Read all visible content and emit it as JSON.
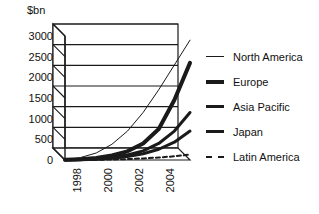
{
  "chart_data": {
    "type": "line",
    "title": "",
    "subtitle": "",
    "xlabel": "",
    "ylabel": "$bn",
    "unit_label": "$bn",
    "grid": true,
    "style": "3d-perspective",
    "legend_position": "right",
    "x": [
      1997,
      1998,
      1999,
      2000,
      2001,
      2002,
      2003,
      2004,
      2005
    ],
    "xtick_labels": [
      "1998",
      "2000",
      "2002",
      "2004"
    ],
    "xtick_values": [
      1998,
      2000,
      2002,
      2004
    ],
    "xlim": [
      1997,
      2005
    ],
    "ylim": [
      0,
      3000
    ],
    "ytick_labels": [
      "0",
      "500",
      "1000",
      "1500",
      "2000",
      "2500",
      "3000"
    ],
    "ytick_values": [
      0,
      500,
      1000,
      1500,
      2000,
      2500,
      3000
    ],
    "series": [
      {
        "name": "North America",
        "values": [
          10,
          60,
          170,
          380,
          700,
          1150,
          1700,
          2300,
          2900
        ],
        "line_width": 1,
        "dash": false,
        "color": "#1a1a1a"
      },
      {
        "name": "Europe",
        "values": [
          5,
          20,
          50,
          110,
          210,
          400,
          750,
          1450,
          2350
        ],
        "line_width": 4,
        "dash": false,
        "color": "#1a1a1a"
      },
      {
        "name": "Asia Pacific",
        "values": [
          3,
          12,
          30,
          65,
          120,
          220,
          400,
          700,
          1150
        ],
        "line_width": 3,
        "dash": false,
        "color": "#1a1a1a"
      },
      {
        "name": "Japan",
        "values": [
          2,
          8,
          20,
          45,
          85,
          150,
          260,
          430,
          700
        ],
        "line_width": 3,
        "dash": false,
        "color": "#1a1a1a"
      },
      {
        "name": "Latin America",
        "values": [
          1,
          3,
          6,
          12,
          22,
          38,
          60,
          90,
          130
        ],
        "line_width": 2,
        "dash": true,
        "color": "#1a1a1a"
      }
    ]
  },
  "legend": {
    "items": [
      {
        "label": "North America",
        "weight_class": "lw-1"
      },
      {
        "label": "Europe",
        "weight_class": "lw-4"
      },
      {
        "label": "Asia Pacific",
        "weight_class": "lw-3"
      },
      {
        "label": "Japan",
        "weight_class": "lw-3"
      },
      {
        "label": "Latin America",
        "weight_class": "lw-dash"
      }
    ]
  },
  "colors": {
    "ink": "#1a1a1a",
    "background": "#ffffff",
    "grid": "#2b2b2b"
  }
}
